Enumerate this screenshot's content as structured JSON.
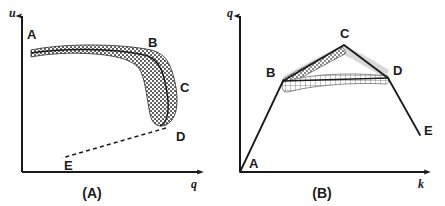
{
  "figure": {
    "panels": [
      {
        "id": "A",
        "caption": "(A)",
        "xaxis_label": "q",
        "yaxis_label": "u",
        "curve_type": "speed-flow",
        "points": [
          {
            "label": "A",
            "x": 0.04,
            "y": 0.86
          },
          {
            "label": "B",
            "x": 0.73,
            "y": 0.78
          },
          {
            "label": "C",
            "x": 0.92,
            "y": 0.58
          },
          {
            "label": "D",
            "x": 0.9,
            "y": 0.3
          },
          {
            "label": "E",
            "x": 0.22,
            "y": 0.06
          }
        ],
        "segments": [
          {
            "from": "A",
            "to": "B",
            "style": "stippled-band"
          },
          {
            "from": "B",
            "to": "C",
            "style": "stippled-band"
          },
          {
            "from": "C",
            "to": "D",
            "style": "stippled-band"
          },
          {
            "from": "D",
            "to": "E",
            "style": "dashed"
          }
        ]
      },
      {
        "id": "B",
        "caption": "(B)",
        "xaxis_label": "k",
        "yaxis_label": "q",
        "curve_type": "flow-density",
        "points": [
          {
            "label": "A",
            "x": 0.0,
            "y": 0.0
          },
          {
            "label": "B",
            "x": 0.27,
            "y": 0.7
          },
          {
            "label": "C",
            "x": 0.59,
            "y": 0.93
          },
          {
            "label": "D",
            "x": 0.85,
            "y": 0.72
          },
          {
            "label": "E",
            "x": 0.98,
            "y": 0.26
          }
        ],
        "segments": [
          {
            "from": "A",
            "to": "B",
            "style": "solid"
          },
          {
            "from": "B",
            "to": "C",
            "style": "solid-stippled-lens"
          },
          {
            "from": "C",
            "to": "D",
            "style": "solid-gray-shadow"
          },
          {
            "from": "B",
            "to": "D",
            "style": "solid-crosshatch-lens"
          },
          {
            "from": "D",
            "to": "E",
            "style": "solid"
          }
        ]
      }
    ],
    "colors": {
      "axis": "#1a1a1a",
      "curve": "#1a1a1a",
      "hatch": "#555555",
      "shadow": "#cccccc"
    }
  }
}
